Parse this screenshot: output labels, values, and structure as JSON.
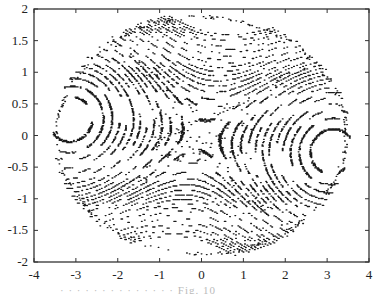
{
  "chart_data": {
    "type": "scatter",
    "title": "",
    "xlabel": "",
    "ylabel": "",
    "xlim": [
      -4,
      4
    ],
    "ylim": [
      -2,
      2
    ],
    "grid": false,
    "legend": null,
    "x_ticks": [
      "-4",
      "-3",
      "-2",
      "-1",
      "0",
      "1",
      "2",
      "3",
      "4"
    ],
    "y_ticks": [
      "2",
      "1.5",
      "1",
      "0.5",
      "0",
      "-0.5",
      "-1",
      "-1.5",
      "-2"
    ],
    "features": [
      {
        "name": "left island",
        "center": [
          -3.2,
          -0.3
        ]
      },
      {
        "name": "right island",
        "center": [
          3.2,
          0.3
        ]
      },
      {
        "name": "chaotic layer",
        "center": [
          0,
          0
        ]
      },
      {
        "name": "boundary",
        "shape": "ellipse",
        "rx": 3.5,
        "ry": 1.9
      }
    ],
    "marker": "dot",
    "color": "#1a1a1a"
  },
  "caption": {
    "text": "· · ·   ·  ·   ·  ·      ·  ·        ·  ·   ·         ·  ·     Fig. 10"
  },
  "colors": {
    "axis": "#333333",
    "points": "#1a1a1a",
    "background": "#ffffff"
  }
}
